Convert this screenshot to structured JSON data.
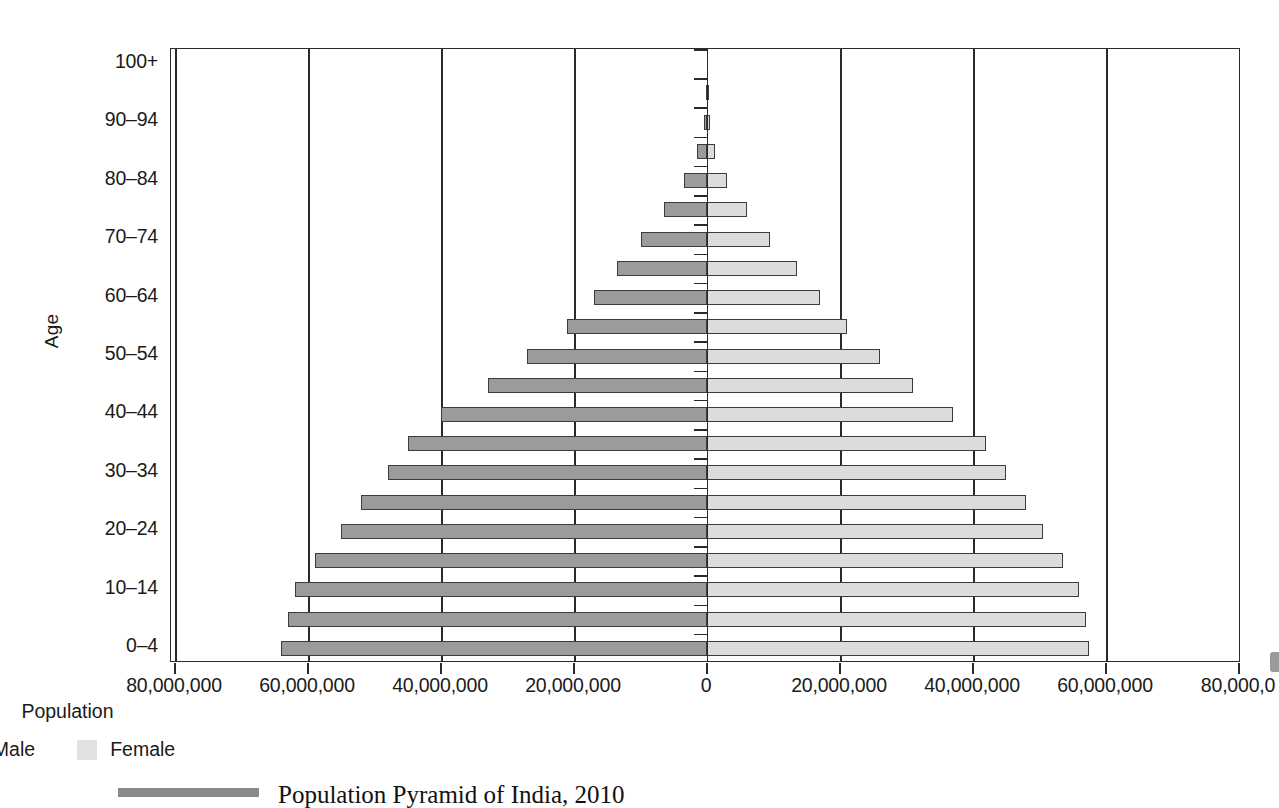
{
  "axes": {
    "y_title": "Age",
    "x_title": "Population",
    "x_ticks": [
      "80,000,000",
      "60,000,000",
      "40,000,000",
      "20,000,000",
      "0",
      "20,000,000",
      "40,000,000",
      "60,000,000",
      "80,000,0"
    ],
    "y_ticks": [
      "0–4",
      "10–14",
      "20–24",
      "30–34",
      "40–44",
      "50–54",
      "60–64",
      "70–74",
      "80–84",
      "90–94",
      "100+"
    ]
  },
  "legend": {
    "male_label": "Male",
    "female_label": "Female",
    "male_color": "#9b9b9b",
    "female_color": "#e2e2e2"
  },
  "caption": {
    "text": "Population Pyramid of India, 2010"
  },
  "chart_data": {
    "type": "bar",
    "title": "Population Pyramid of India, 2010",
    "subtype": "population-pyramid",
    "xlabel": "Population",
    "ylabel": "Age",
    "xlim": [
      -80000000,
      80000000
    ],
    "x_tick_values": [
      -80000000,
      -60000000,
      -40000000,
      -20000000,
      0,
      20000000,
      40000000,
      60000000,
      80000000
    ],
    "grid": true,
    "legend_position": "bottom",
    "categories": [
      "0–4",
      "5–9",
      "10–14",
      "15–19",
      "20–24",
      "25–29",
      "30–34",
      "35–39",
      "40–44",
      "45–49",
      "50–54",
      "55–59",
      "60–64",
      "65–69",
      "70–74",
      "75–79",
      "80–84",
      "85–89",
      "90–94",
      "95–99",
      "100+"
    ],
    "series": [
      {
        "name": "Male",
        "values": [
          64000000,
          63000000,
          62000000,
          59000000,
          55000000,
          52000000,
          48000000,
          45000000,
          40000000,
          33000000,
          27000000,
          21000000,
          17000000,
          13500000,
          10000000,
          6500000,
          3500000,
          1500000,
          500000,
          150000,
          40000
        ]
      },
      {
        "name": "Female",
        "values": [
          57500000,
          57000000,
          56000000,
          53500000,
          50500000,
          48000000,
          45000000,
          42000000,
          37000000,
          31000000,
          26000000,
          21000000,
          17000000,
          13500000,
          9500000,
          6000000,
          3000000,
          1200000,
          400000,
          120000,
          30000
        ]
      }
    ]
  }
}
